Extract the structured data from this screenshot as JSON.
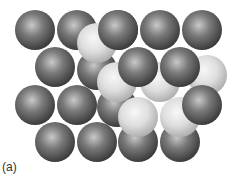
{
  "figure": {
    "label": "(a)",
    "colors": {
      "dark_sphere": "#6a6a6a",
      "light_sphere": "#d8d8d8"
    },
    "spheres_back": [
      {
        "x": 97,
        "y": 70,
        "shade": "dark"
      },
      {
        "x": 117,
        "y": 107,
        "shade": "dark"
      }
    ],
    "spheres_dark": [
      {
        "x": 35,
        "y": 30
      },
      {
        "x": 77,
        "y": 30
      },
      {
        "x": 118,
        "y": 30
      },
      {
        "x": 160,
        "y": 30
      },
      {
        "x": 202,
        "y": 30
      },
      {
        "x": 55,
        "y": 67
      },
      {
        "x": 35,
        "y": 105
      },
      {
        "x": 77,
        "y": 105
      },
      {
        "x": 55,
        "y": 142
      },
      {
        "x": 97,
        "y": 142
      },
      {
        "x": 138,
        "y": 142
      },
      {
        "x": 180,
        "y": 142
      }
    ],
    "spheres_light": [
      {
        "x": 97,
        "y": 43
      },
      {
        "x": 117,
        "y": 82
      },
      {
        "x": 160,
        "y": 82
      },
      {
        "x": 207,
        "y": 75
      },
      {
        "x": 138,
        "y": 117
      },
      {
        "x": 180,
        "y": 117
      }
    ],
    "spheres_front": [
      {
        "x": 118,
        "y": 30
      },
      {
        "x": 138,
        "y": 67
      },
      {
        "x": 180,
        "y": 67
      },
      {
        "x": 202,
        "y": 105
      }
    ],
    "radius": 20
  }
}
